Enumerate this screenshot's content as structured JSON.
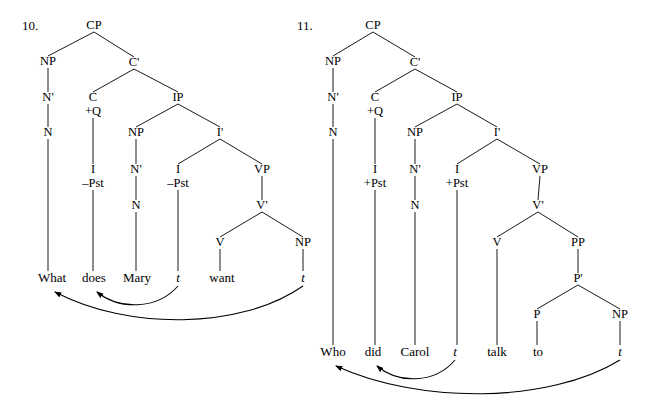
{
  "figure": {
    "kind": "syntax-trees",
    "background": "#ffffff",
    "ink": "#000000"
  },
  "trees": [
    {
      "id": "tree-10",
      "number": "10.",
      "number_pos": {
        "x": 22,
        "y": 26
      },
      "sentence": "What does Mary t want t",
      "nodes": [
        {
          "name": "cp",
          "label": "CP",
          "x": 94,
          "y": 26
        },
        {
          "name": "np-spec",
          "label": "NP",
          "x": 48,
          "y": 62
        },
        {
          "name": "cbar",
          "label": "C'",
          "x": 134,
          "y": 63
        },
        {
          "name": "nbar",
          "label": "N'",
          "x": 48,
          "y": 98
        },
        {
          "name": "c",
          "label": "C",
          "x": 93,
          "y": 98
        },
        {
          "name": "c-feature",
          "label": "+Q",
          "x": 93,
          "y": 112
        },
        {
          "name": "ip",
          "label": "IP",
          "x": 178,
          "y": 98
        },
        {
          "name": "n",
          "label": "N",
          "x": 48,
          "y": 133
        },
        {
          "name": "np-subj",
          "label": "NP",
          "x": 136,
          "y": 133
        },
        {
          "name": "ibar",
          "label": "I'",
          "x": 220,
          "y": 133
        },
        {
          "name": "i-in-c",
          "label": "I",
          "x": 93,
          "y": 170
        },
        {
          "name": "i-in-c-feature",
          "label": "–Pst",
          "x": 93,
          "y": 184
        },
        {
          "name": "nbar-subj",
          "label": "N'",
          "x": 136,
          "y": 170
        },
        {
          "name": "i",
          "label": "I",
          "x": 178,
          "y": 170
        },
        {
          "name": "i-feature",
          "label": "–Pst",
          "x": 178,
          "y": 184
        },
        {
          "name": "vp",
          "label": "VP",
          "x": 262,
          "y": 170
        },
        {
          "name": "n-subj",
          "label": "N",
          "x": 136,
          "y": 206
        },
        {
          "name": "vbar",
          "label": "V'",
          "x": 262,
          "y": 206
        },
        {
          "name": "v",
          "label": "V",
          "x": 220,
          "y": 243
        },
        {
          "name": "np-obj",
          "label": "NP",
          "x": 303,
          "y": 243
        }
      ],
      "edges": [
        [
          94,
          32,
          48,
          56
        ],
        [
          94,
          32,
          134,
          57
        ],
        [
          48,
          68,
          48,
          92
        ],
        [
          134,
          69,
          93,
          92
        ],
        [
          134,
          69,
          178,
          92
        ],
        [
          48,
          104,
          48,
          127
        ],
        [
          93,
          118,
          93,
          164
        ],
        [
          178,
          104,
          136,
          127
        ],
        [
          178,
          104,
          220,
          127
        ],
        [
          48,
          139,
          48,
          271
        ],
        [
          136,
          139,
          136,
          164
        ],
        [
          220,
          139,
          178,
          164
        ],
        [
          220,
          139,
          262,
          164
        ],
        [
          93,
          190,
          93,
          271
        ],
        [
          136,
          176,
          136,
          200
        ],
        [
          178,
          190,
          178,
          271
        ],
        [
          262,
          176,
          262,
          200
        ],
        [
          136,
          212,
          136,
          271
        ],
        [
          262,
          212,
          220,
          237
        ],
        [
          262,
          212,
          303,
          237
        ],
        [
          220,
          249,
          220,
          271
        ],
        [
          303,
          249,
          303,
          271
        ]
      ],
      "leaves": [
        {
          "name": "leaf-what",
          "label": "What",
          "x": 52,
          "y": 278,
          "italic": false
        },
        {
          "name": "leaf-does",
          "label": "does",
          "x": 94,
          "y": 278,
          "italic": false
        },
        {
          "name": "leaf-mary",
          "label": "Mary",
          "x": 137,
          "y": 278,
          "italic": false
        },
        {
          "name": "leaf-trace-subject",
          "label": "t",
          "x": 178,
          "y": 278,
          "italic": true
        },
        {
          "name": "leaf-want",
          "label": "want",
          "x": 222,
          "y": 278,
          "italic": false
        },
        {
          "name": "leaf-trace-object",
          "label": "t",
          "x": 303,
          "y": 278,
          "italic": true
        }
      ],
      "movements": [
        {
          "name": "movement-i-to-c",
          "from_x": 178,
          "to_x": 94,
          "base_y": 286,
          "depth": 24
        },
        {
          "name": "movement-wh",
          "from_x": 303,
          "to_x": 52,
          "base_y": 286,
          "depth": 44
        }
      ]
    },
    {
      "id": "tree-11",
      "number": "11.",
      "number_pos": {
        "x": 297,
        "y": 26
      },
      "sentence": "Who did Carol t talk to t",
      "nodes": [
        {
          "name": "cp",
          "label": "CP",
          "x": 373,
          "y": 26
        },
        {
          "name": "np-spec",
          "label": "NP",
          "x": 333,
          "y": 62
        },
        {
          "name": "cbar",
          "label": "C'",
          "x": 415,
          "y": 63
        },
        {
          "name": "nbar",
          "label": "N'",
          "x": 333,
          "y": 98
        },
        {
          "name": "c",
          "label": "C",
          "x": 375,
          "y": 98
        },
        {
          "name": "c-feature",
          "label": "+Q",
          "x": 375,
          "y": 112
        },
        {
          "name": "ip",
          "label": "IP",
          "x": 457,
          "y": 98
        },
        {
          "name": "n",
          "label": "N",
          "x": 333,
          "y": 133
        },
        {
          "name": "np-subj",
          "label": "NP",
          "x": 415,
          "y": 133
        },
        {
          "name": "ibar",
          "label": "I'",
          "x": 497,
          "y": 133
        },
        {
          "name": "i-in-c",
          "label": "I",
          "x": 375,
          "y": 170
        },
        {
          "name": "i-in-c-feature",
          "label": "+Pst",
          "x": 375,
          "y": 184
        },
        {
          "name": "nbar-subj",
          "label": "N'",
          "x": 415,
          "y": 170
        },
        {
          "name": "i",
          "label": "I",
          "x": 457,
          "y": 170
        },
        {
          "name": "i-feature",
          "label": "+Pst",
          "x": 457,
          "y": 184
        },
        {
          "name": "vp",
          "label": "VP",
          "x": 540,
          "y": 170
        },
        {
          "name": "n-subj",
          "label": "N",
          "x": 415,
          "y": 206
        },
        {
          "name": "vbar",
          "label": "V'",
          "x": 538,
          "y": 206
        },
        {
          "name": "v",
          "label": "V",
          "x": 497,
          "y": 243
        },
        {
          "name": "pp",
          "label": "PP",
          "x": 578,
          "y": 243
        },
        {
          "name": "pbar",
          "label": "P'",
          "x": 578,
          "y": 279
        },
        {
          "name": "p",
          "label": "P",
          "x": 537,
          "y": 315
        },
        {
          "name": "np-obj",
          "label": "NP",
          "x": 620,
          "y": 315
        }
      ],
      "edges": [
        [
          373,
          32,
          333,
          56
        ],
        [
          373,
          32,
          415,
          57
        ],
        [
          333,
          68,
          333,
          92
        ],
        [
          415,
          69,
          375,
          92
        ],
        [
          415,
          69,
          457,
          92
        ],
        [
          333,
          104,
          333,
          127
        ],
        [
          375,
          118,
          375,
          164
        ],
        [
          457,
          104,
          415,
          127
        ],
        [
          457,
          104,
          497,
          127
        ],
        [
          333,
          139,
          333,
          345
        ],
        [
          415,
          139,
          415,
          164
        ],
        [
          497,
          139,
          457,
          164
        ],
        [
          497,
          139,
          540,
          164
        ],
        [
          375,
          190,
          375,
          345
        ],
        [
          415,
          176,
          415,
          200
        ],
        [
          457,
          190,
          457,
          345
        ],
        [
          540,
          176,
          538,
          200
        ],
        [
          415,
          212,
          415,
          345
        ],
        [
          538,
          212,
          497,
          237
        ],
        [
          538,
          212,
          578,
          237
        ],
        [
          497,
          249,
          497,
          345
        ],
        [
          578,
          249,
          578,
          273
        ],
        [
          578,
          285,
          537,
          309
        ],
        [
          578,
          285,
          620,
          309
        ],
        [
          537,
          321,
          537,
          345
        ],
        [
          620,
          321,
          620,
          345
        ]
      ],
      "leaves": [
        {
          "name": "leaf-who",
          "label": "Who",
          "x": 333,
          "y": 352,
          "italic": false
        },
        {
          "name": "leaf-did",
          "label": "did",
          "x": 373,
          "y": 352,
          "italic": false
        },
        {
          "name": "leaf-carol",
          "label": "Carol",
          "x": 415,
          "y": 352,
          "italic": false
        },
        {
          "name": "leaf-trace-subject",
          "label": "t",
          "x": 455,
          "y": 352,
          "italic": true
        },
        {
          "name": "leaf-talk",
          "label": "talk",
          "x": 497,
          "y": 352,
          "italic": false
        },
        {
          "name": "leaf-to",
          "label": "to",
          "x": 538,
          "y": 352,
          "italic": false
        },
        {
          "name": "leaf-trace-object",
          "label": "t",
          "x": 620,
          "y": 352,
          "italic": true
        }
      ],
      "movements": [
        {
          "name": "movement-i-to-c",
          "from_x": 455,
          "to_x": 374,
          "base_y": 360,
          "depth": 24
        },
        {
          "name": "movement-wh",
          "from_x": 620,
          "to_x": 333,
          "base_y": 360,
          "depth": 44
        }
      ]
    }
  ]
}
